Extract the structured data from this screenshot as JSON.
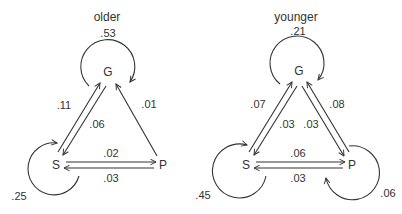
{
  "diagrams": [
    {
      "title": "older",
      "nodes": {
        "G": "G",
        "S": "S",
        "P": "P"
      },
      "self_loops": {
        "G": ".53",
        "S": ".25"
      },
      "edges": {
        "S_to_G": ".11",
        "G_to_S": ".06",
        "P_to_G": ".01",
        "S_to_P": ".02",
        "P_to_S": ".03"
      }
    },
    {
      "title": "younger",
      "nodes": {
        "G": "G",
        "S": "S",
        "P": "P"
      },
      "self_loops": {
        "G": ".21",
        "S": ".45",
        "P": ".06"
      },
      "edges": {
        "S_to_G": ".07",
        "G_to_S": ".03",
        "G_to_P": ".03",
        "P_to_G": ".08",
        "S_to_P": ".06",
        "P_to_S": ".03"
      }
    }
  ],
  "colors": {
    "ink": "#333333",
    "background": "#ffffff"
  }
}
